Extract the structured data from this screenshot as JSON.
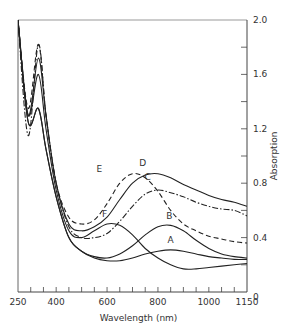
{
  "chart_data": {
    "type": "line",
    "title": "",
    "xlabel": "Wavelength (nm)",
    "ylabel": "Absorption",
    "xlim": [
      250,
      1150
    ],
    "ylim": [
      0,
      2.0
    ],
    "x_ticks": [
      250,
      400,
      600,
      800,
      1000,
      1150
    ],
    "x_tick_labels": [
      "250",
      "400",
      "600",
      "800",
      "1000",
      "1150"
    ],
    "y_ticks": [
      0,
      0.4,
      0.8,
      1.2,
      1.6,
      2.0
    ],
    "y_tick_labels": [
      "0",
      "0.4",
      "0.8",
      "1.2",
      "1.6",
      "2.0"
    ],
    "y_axis_position": "right",
    "grid": false,
    "legend": "none (curves labelled inline A–F)",
    "series": [
      {
        "name": "A",
        "style": "solid",
        "x": [
          250,
          290,
          330,
          360,
          400,
          450,
          500,
          550,
          600,
          650,
          700,
          750,
          800,
          850,
          900,
          950,
          1000,
          1050,
          1100,
          1150
        ],
        "y": [
          2.0,
          1.25,
          1.35,
          1.05,
          0.7,
          0.4,
          0.3,
          0.25,
          0.23,
          0.23,
          0.25,
          0.28,
          0.3,
          0.31,
          0.3,
          0.28,
          0.26,
          0.25,
          0.24,
          0.24
        ]
      },
      {
        "name": "B",
        "style": "solid",
        "x": [
          250,
          290,
          330,
          360,
          400,
          450,
          500,
          550,
          600,
          650,
          700,
          750,
          800,
          850,
          900,
          950,
          1000,
          1050,
          1100,
          1150
        ],
        "y": [
          2.0,
          1.25,
          1.35,
          1.05,
          0.7,
          0.4,
          0.3,
          0.26,
          0.25,
          0.28,
          0.34,
          0.42,
          0.48,
          0.49,
          0.45,
          0.38,
          0.32,
          0.28,
          0.26,
          0.25
        ]
      },
      {
        "name": "C",
        "style": "dash-dot",
        "x": [
          250,
          290,
          330,
          360,
          400,
          450,
          500,
          550,
          600,
          650,
          700,
          750,
          800,
          850,
          900,
          950,
          1000,
          1050,
          1100,
          1150
        ],
        "y": [
          2.0,
          1.15,
          1.82,
          1.3,
          0.8,
          0.48,
          0.4,
          0.4,
          0.43,
          0.52,
          0.63,
          0.72,
          0.75,
          0.73,
          0.7,
          0.66,
          0.63,
          0.61,
          0.6,
          0.56
        ]
      },
      {
        "name": "D",
        "style": "solid",
        "x": [
          250,
          290,
          330,
          360,
          400,
          450,
          500,
          550,
          600,
          650,
          700,
          750,
          800,
          850,
          900,
          950,
          1000,
          1050,
          1100,
          1150
        ],
        "y": [
          2.0,
          1.3,
          1.72,
          1.3,
          0.8,
          0.5,
          0.45,
          0.48,
          0.55,
          0.68,
          0.8,
          0.86,
          0.87,
          0.84,
          0.79,
          0.75,
          0.71,
          0.68,
          0.66,
          0.63
        ]
      },
      {
        "name": "E",
        "style": "dashed",
        "x": [
          250,
          290,
          330,
          360,
          400,
          450,
          500,
          550,
          600,
          650,
          700,
          750,
          800,
          850,
          900,
          950,
          1000,
          1050,
          1100,
          1150
        ],
        "y": [
          2.0,
          1.35,
          1.82,
          1.3,
          0.8,
          0.55,
          0.5,
          0.53,
          0.65,
          0.8,
          0.87,
          0.84,
          0.74,
          0.6,
          0.5,
          0.45,
          0.41,
          0.39,
          0.37,
          0.36
        ]
      },
      {
        "name": "F",
        "style": "solid",
        "x": [
          250,
          290,
          330,
          360,
          400,
          450,
          500,
          550,
          600,
          650,
          700,
          750,
          800,
          850,
          900,
          950,
          1000,
          1050,
          1100,
          1150
        ],
        "y": [
          2.0,
          1.3,
          1.6,
          1.2,
          0.75,
          0.45,
          0.4,
          0.45,
          0.5,
          0.49,
          0.42,
          0.32,
          0.25,
          0.2,
          0.17,
          0.17,
          0.18,
          0.19,
          0.2,
          0.21
        ]
      }
    ],
    "annotations": [
      {
        "text": "A",
        "x": 850,
        "y": 0.36
      },
      {
        "text": "B",
        "x": 845,
        "y": 0.54
      },
      {
        "text": "C",
        "x": 760,
        "y": 0.82
      },
      {
        "text": "D",
        "x": 740,
        "y": 0.93
      },
      {
        "text": "E",
        "x": 570,
        "y": 0.88
      },
      {
        "text": "F",
        "x": 590,
        "y": 0.55
      }
    ]
  }
}
